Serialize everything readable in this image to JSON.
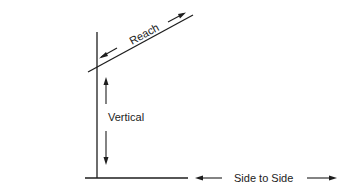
{
  "diagram": {
    "type": "reach-zone-dimensions",
    "labels": {
      "reach": "Reach",
      "vertical": "Vertical",
      "side_to_side": "Side to Side"
    },
    "arrows": {
      "reach": "bidirectional-diagonal",
      "vertical": "bidirectional-vertical",
      "side_to_side": "bidirectional-horizontal"
    },
    "colors": {
      "line": "#1e1e1e",
      "text": "#222222",
      "background": "#ffffff"
    }
  }
}
